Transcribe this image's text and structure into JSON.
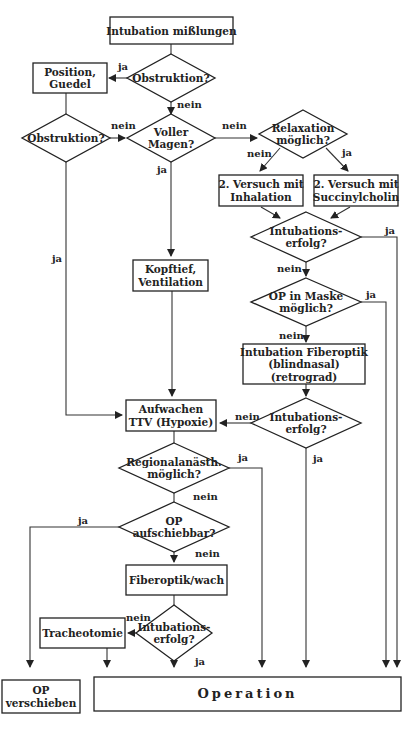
{
  "diagram": {
    "title": "Intubation mißlungen",
    "nodes": [
      {
        "id": "start",
        "type": "box",
        "lines": [
          "Intubation mißlungen"
        ],
        "x": 110,
        "y": 17,
        "w": 123,
        "h": 27
      },
      {
        "id": "obstr1",
        "type": "diamond",
        "lines": [
          "Obstruktion?"
        ],
        "cx": 171,
        "cy": 78,
        "w": 88,
        "h": 48
      },
      {
        "id": "position",
        "type": "box",
        "lines": [
          "Position,",
          "Guedel"
        ],
        "x": 33,
        "y": 63,
        "w": 74,
        "h": 30
      },
      {
        "id": "obstr2",
        "type": "diamond",
        "lines": [
          "Obstruktion?"
        ],
        "cx": 66,
        "cy": 138,
        "w": 88,
        "h": 48
      },
      {
        "id": "vollermagen",
        "type": "diamond",
        "lines": [
          "Voller",
          "Magen?"
        ],
        "cx": 171,
        "cy": 138,
        "w": 88,
        "h": 48
      },
      {
        "id": "relaxation",
        "type": "diamond",
        "lines": [
          "Relaxation",
          "möglich?"
        ],
        "cx": 303,
        "cy": 134,
        "w": 88,
        "h": 48
      },
      {
        "id": "inhalation",
        "type": "box",
        "lines": [
          "2. Versuch mit",
          "Inhalation"
        ],
        "x": 219,
        "y": 175,
        "w": 84,
        "h": 31
      },
      {
        "id": "succinyl",
        "type": "box",
        "lines": [
          "2. Versuch mit",
          "Succinylcholin"
        ],
        "x": 314,
        "y": 175,
        "w": 84,
        "h": 31
      },
      {
        "id": "erfolg1",
        "type": "diamond",
        "lines": [
          "Intubations-",
          "erfolg?"
        ],
        "cx": 306,
        "cy": 237,
        "w": 110,
        "h": 50
      },
      {
        "id": "opmaske",
        "type": "diamond",
        "lines": [
          "OP in Maske",
          "möglich?"
        ],
        "cx": 306,
        "cy": 302,
        "w": 110,
        "h": 48
      },
      {
        "id": "fiberoptik1",
        "type": "box",
        "lines": [
          "Intubation Fiberoptik",
          "(blindnasal)",
          "(retrograd)"
        ],
        "x": 243,
        "y": 344,
        "w": 122,
        "h": 40
      },
      {
        "id": "erfolg2",
        "type": "diamond",
        "lines": [
          "Intubations-",
          "erfolg?"
        ],
        "cx": 306,
        "cy": 423,
        "w": 110,
        "h": 50
      },
      {
        "id": "kopftief",
        "type": "box",
        "lines": [
          "Kopftief,",
          "Ventilation"
        ],
        "x": 133,
        "y": 260,
        "w": 75,
        "h": 31
      },
      {
        "id": "aufwachen",
        "type": "box",
        "lines": [
          "Aufwachen",
          "TTV (Hypoxie)"
        ],
        "x": 126,
        "y": 400,
        "w": 90,
        "h": 31
      },
      {
        "id": "regional",
        "type": "diamond",
        "lines": [
          "Regionalanästh.",
          "möglich?"
        ],
        "cx": 174,
        "cy": 468,
        "w": 110,
        "h": 50
      },
      {
        "id": "aufschiebbar",
        "type": "diamond",
        "lines": [
          "OP",
          "aufschiebbar?"
        ],
        "cx": 174,
        "cy": 527,
        "w": 110,
        "h": 50
      },
      {
        "id": "fiberwach",
        "type": "box",
        "lines": [
          "Fiberoptik/wach"
        ],
        "x": 126,
        "y": 565,
        "w": 101,
        "h": 30
      },
      {
        "id": "erfolg3",
        "type": "diamond",
        "lines": [
          "Intubations-",
          "erfolg?"
        ],
        "cx": 174,
        "cy": 633,
        "w": 76,
        "h": 56
      },
      {
        "id": "tracheo",
        "type": "box",
        "lines": [
          "Tracheotomie"
        ],
        "x": 40,
        "y": 618,
        "w": 85,
        "h": 30
      },
      {
        "id": "opverschieben",
        "type": "box",
        "lines": [
          "OP",
          "verschieben"
        ],
        "x": 2,
        "y": 680,
        "w": 78,
        "h": 33
      },
      {
        "id": "operation",
        "type": "box-op",
        "lines": [
          "Operation"
        ],
        "x": 94,
        "y": 677,
        "w": 307,
        "h": 34
      }
    ],
    "edges": [
      {
        "pts": [
          [
            171,
            44
          ],
          [
            171,
            54
          ]
        ],
        "arrow": false
      },
      {
        "pts": [
          [
            127,
            78
          ],
          [
            109,
            78
          ]
        ],
        "arrow": true,
        "label": "ja",
        "lx": 118,
        "ly": 70
      },
      {
        "pts": [
          [
            171,
            102
          ],
          [
            171,
            114
          ]
        ],
        "arrow": true,
        "label": "nein",
        "lx": 177,
        "ly": 108
      },
      {
        "pts": [
          [
            66,
            93
          ],
          [
            66,
            114
          ]
        ],
        "arrow": false
      },
      {
        "pts": [
          [
            110,
            138
          ],
          [
            125,
            138
          ]
        ],
        "arrow": true,
        "label": "nein",
        "lx": 111,
        "ly": 129
      },
      {
        "pts": [
          [
            215,
            138
          ],
          [
            257,
            138
          ]
        ],
        "arrow": true,
        "label": "nein",
        "lx": 222,
        "ly": 129
      },
      {
        "pts": [
          [
            280,
            148
          ],
          [
            260,
            171
          ]
        ],
        "arrow": true,
        "label": "nein",
        "lx": 247,
        "ly": 157
      },
      {
        "pts": [
          [
            326,
            148
          ],
          [
            348,
            171
          ]
        ],
        "arrow": true,
        "label": "ja",
        "lx": 342,
        "ly": 156
      },
      {
        "pts": [
          [
            261,
            207
          ],
          [
            280,
            218
          ]
        ],
        "arrow": true
      },
      {
        "pts": [
          [
            350,
            207
          ],
          [
            331,
            218
          ]
        ],
        "arrow": true
      },
      {
        "pts": [
          [
            306,
            262
          ],
          [
            306,
            276
          ]
        ],
        "arrow": true,
        "label": "nein",
        "lx": 277,
        "ly": 272
      },
      {
        "pts": [
          [
            361,
            237
          ],
          [
            397,
            237
          ],
          [
            397,
            667
          ]
        ],
        "arrow": true,
        "label": "ja",
        "lx": 385,
        "ly": 234
      },
      {
        "pts": [
          [
            361,
            302
          ],
          [
            386,
            302
          ],
          [
            386,
            667
          ]
        ],
        "arrow": true,
        "label": "ja",
        "lx": 366,
        "ly": 298
      },
      {
        "pts": [
          [
            306,
            326
          ],
          [
            306,
            342
          ]
        ],
        "arrow": true,
        "label": "nein",
        "lx": 279,
        "ly": 339
      },
      {
        "pts": [
          [
            306,
            384
          ],
          [
            306,
            396
          ]
        ],
        "arrow": true
      },
      {
        "pts": [
          [
            251,
            423
          ],
          [
            220,
            423
          ]
        ],
        "arrow": true,
        "label": "nein",
        "lx": 235,
        "ly": 420
      },
      {
        "pts": [
          [
            306,
            448
          ],
          [
            306,
            667
          ]
        ],
        "arrow": true,
        "label": "ja",
        "lx": 313,
        "ly": 462
      },
      {
        "pts": [
          [
            171,
            162
          ],
          [
            171,
            256
          ]
        ],
        "arrow": true,
        "label": "ja",
        "lx": 157,
        "ly": 173
      },
      {
        "pts": [
          [
            66,
            162
          ],
          [
            66,
            415
          ],
          [
            122,
            415
          ]
        ],
        "arrow": true,
        "label": "ja",
        "lx": 52,
        "ly": 262
      },
      {
        "pts": [
          [
            172,
            291
          ],
          [
            172,
            396
          ]
        ],
        "arrow": true
      },
      {
        "pts": [
          [
            174,
            431
          ],
          [
            174,
            443
          ]
        ],
        "arrow": false
      },
      {
        "pts": [
          [
            229,
            468
          ],
          [
            262,
            468
          ],
          [
            262,
            667
          ]
        ],
        "arrow": true,
        "label": "ja",
        "lx": 238,
        "ly": 461
      },
      {
        "pts": [
          [
            174,
            493
          ],
          [
            174,
            502
          ]
        ],
        "arrow": false,
        "label": "nein",
        "lx": 193,
        "ly": 500
      },
      {
        "pts": [
          [
            119,
            527
          ],
          [
            30,
            527
          ],
          [
            30,
            667
          ]
        ],
        "arrow": true,
        "label": "ja",
        "lx": 78,
        "ly": 524
      },
      {
        "pts": [
          [
            174,
            552
          ],
          [
            174,
            562
          ]
        ],
        "arrow": true,
        "label": "nein",
        "lx": 195,
        "ly": 557
      },
      {
        "pts": [
          [
            174,
            595
          ],
          [
            174,
            605
          ]
        ],
        "arrow": false
      },
      {
        "pts": [
          [
            136,
            633
          ],
          [
            128,
            633
          ]
        ],
        "arrow": true,
        "label": "nein",
        "lx": 126,
        "ly": 621
      },
      {
        "pts": [
          [
            107,
            648
          ],
          [
            107,
            667
          ]
        ],
        "arrow": true
      },
      {
        "pts": [
          [
            174,
            661
          ],
          [
            174,
            667
          ]
        ],
        "arrow": true,
        "label": "ja",
        "lx": 195,
        "ly": 665
      }
    ]
  }
}
